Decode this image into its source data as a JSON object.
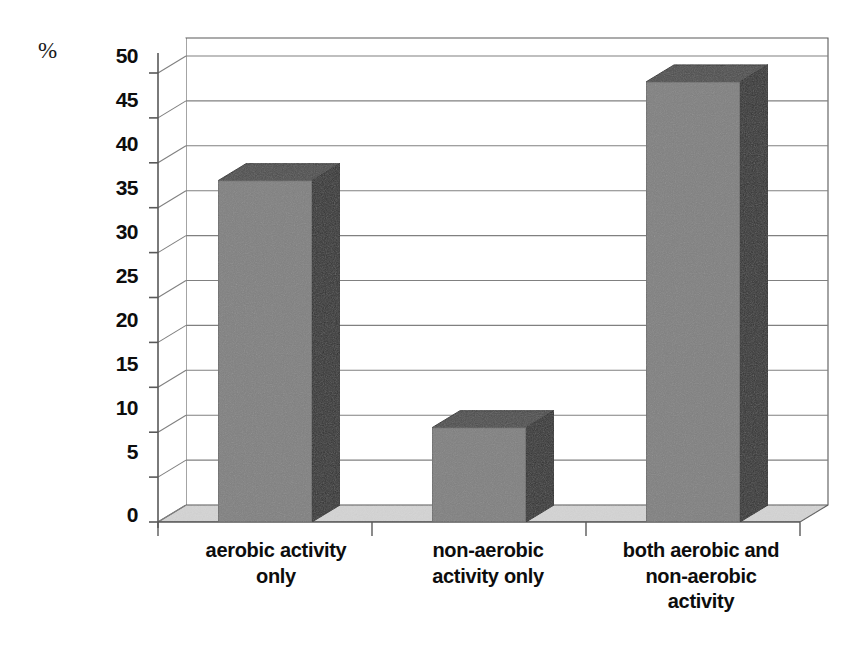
{
  "chart_data": {
    "type": "bar",
    "title": "",
    "subtitle": "",
    "xlabel": "",
    "ylabel": "%",
    "ylim": [
      0,
      52
    ],
    "grid": true,
    "legend": null,
    "style": "3d-column",
    "categories": [
      "aerobic activity only",
      "non-aerobic activity only",
      "both aerobic and non-aerobic activity"
    ],
    "category_lines": [
      [
        "aerobic activity",
        "only"
      ],
      [
        "non-aerobic",
        "activity only"
      ],
      [
        "both aerobic and",
        "non-aerobic",
        "activity"
      ]
    ],
    "values": [
      38,
      10.5,
      49
    ],
    "yticks": [
      0,
      5,
      10,
      15,
      20,
      25,
      30,
      35,
      40,
      45,
      50
    ],
    "ytick_labels": [
      "0",
      "5",
      "10",
      "15",
      "20",
      "25",
      "30",
      "35",
      "40",
      "45",
      "50"
    ],
    "colors": {
      "bar_front": "#808080",
      "bar_side": "#333333",
      "bar_top": "#4d4d4d",
      "floor": "#d4d4d4",
      "wall": "#ffffff",
      "gridline": "#808080",
      "axis": "#595959",
      "text": "#0d0d0d"
    }
  },
  "axis": {
    "unit_label": "%"
  }
}
